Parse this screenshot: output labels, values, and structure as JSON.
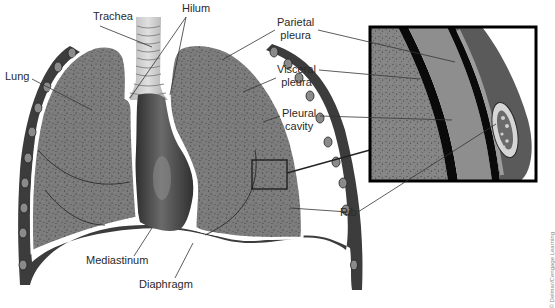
{
  "figure": {
    "colors": {
      "lung_fill": "#7a7a7a",
      "lung_speckle": "#3a3a3a",
      "pleura_line": "#ffffff",
      "chest_wall": "#3c3c3c",
      "rib": "#9a9a9a",
      "mediastinum": "#4a4a4a",
      "trachea": "#c8c8c8",
      "inset_border": "#000000",
      "pleural_cavity": "#8c8c8c",
      "leader_line": "#333333",
      "label_text": "#2a2a2a"
    }
  },
  "labels": {
    "trachea": "Trachea",
    "hilum": "Hilum",
    "lung": "Lung",
    "parietal_pleura_1": "Parietal",
    "parietal_pleura_2": "pleura",
    "visceral_pleura_1": "Visceral",
    "visceral_pleura_2": "pleura",
    "pleural_cavity_1": "Pleural",
    "pleural_cavity_2": "cavity",
    "rib": "Rib",
    "mediastinum": "Mediastinum",
    "diaphragm": "Diaphragm"
  },
  "credit": "© Delmar/Cengage Learning"
}
